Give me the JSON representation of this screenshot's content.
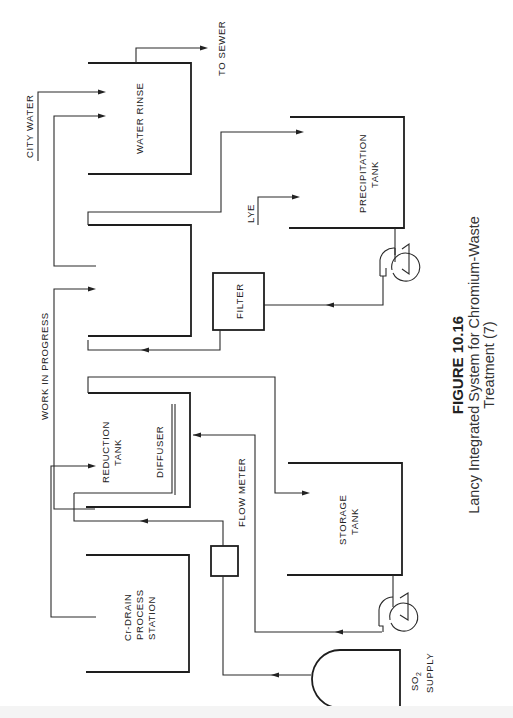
{
  "figure": {
    "number": "FIGURE 10.16",
    "caption_line1": "Lancy Integrated System for Chromium-Waste",
    "caption_line2": "Treatment (7)"
  },
  "components": {
    "water_rinse": {
      "label": "WATER RINSE"
    },
    "precipitation_tank": {
      "label_line1": "PRECIPITATION",
      "label_line2": "TANK"
    },
    "filter": {
      "label": "FILTER"
    },
    "reduction_tank": {
      "label_line1": "REDUCTION",
      "label_line2": "TANK"
    },
    "diffuser": {
      "label": "DIFFUSER"
    },
    "flow_meter": {
      "label": "FLOW METER"
    },
    "storage_tank": {
      "label_line1": "STORAGE",
      "label_line2": "TANK"
    },
    "cr_drain": {
      "label_line1": "Cr-DRAIN",
      "label_line2": "PROCESS",
      "label_line3": "STATION"
    },
    "so2_supply": {
      "label_line1_main": "SO",
      "label_line1_sub": "2",
      "label_line2": "SUPPLY"
    }
  },
  "streams": {
    "city_water": "CITY WATER",
    "to_sewer": "TO SEWER",
    "work_in_progress": "WORK IN PROGRESS",
    "lye": "LYE"
  }
}
